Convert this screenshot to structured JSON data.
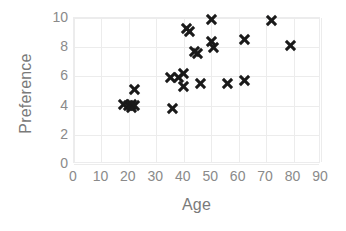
{
  "chart_data": {
    "type": "scatter",
    "title": "",
    "xlabel": "Age",
    "ylabel": "Preference",
    "xlim": [
      0,
      90
    ],
    "ylim": [
      0,
      10
    ],
    "xticks": [
      0,
      10,
      20,
      30,
      40,
      50,
      60,
      70,
      80,
      90
    ],
    "yticks": [
      0,
      2,
      4,
      6,
      8,
      10
    ],
    "grid": true,
    "legend": null,
    "marker": "x",
    "marker_color": "#1a1a1a",
    "series": [
      {
        "name": "Age vs Preference",
        "points": [
          [
            18,
            4.1
          ],
          [
            20,
            4.0
          ],
          [
            21,
            3.9
          ],
          [
            21,
            4.1
          ],
          [
            22,
            4.0
          ],
          [
            22,
            5.1
          ],
          [
            35,
            5.9
          ],
          [
            36,
            3.8
          ],
          [
            38,
            5.9
          ],
          [
            40,
            6.2
          ],
          [
            40,
            5.3
          ],
          [
            41,
            9.3
          ],
          [
            42,
            9.1
          ],
          [
            44,
            7.7
          ],
          [
            45,
            7.6
          ],
          [
            46,
            5.5
          ],
          [
            50,
            9.9
          ],
          [
            50,
            8.4
          ],
          [
            51,
            8.0
          ],
          [
            56,
            5.5
          ],
          [
            62,
            8.5
          ],
          [
            62,
            5.7
          ],
          [
            72,
            9.8
          ],
          [
            79,
            8.1
          ]
        ]
      }
    ]
  },
  "axes": {
    "x_title": "Age",
    "y_title": "Preference",
    "x_tick_labels": [
      "0",
      "10",
      "20",
      "30",
      "40",
      "50",
      "60",
      "70",
      "80",
      "90"
    ],
    "y_tick_labels": [
      "0",
      "2",
      "4",
      "6",
      "8",
      "10"
    ]
  },
  "colors": {
    "marker": "#1a1a1a",
    "grid": "#ececec",
    "tick_text": "#8a8a8a",
    "title_text": "#7a7a7a",
    "background": "#ffffff"
  }
}
